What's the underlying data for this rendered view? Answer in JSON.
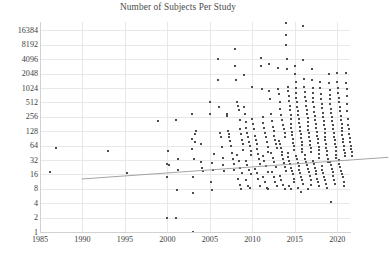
{
  "chart_data": {
    "type": "scatter",
    "title": "Number of Subjects Per Study",
    "xlabel": "",
    "ylabel": "",
    "yscale": "log2",
    "xlim": [
      1985,
      2021.5
    ],
    "ylim": [
      1,
      24576
    ],
    "grid": true,
    "legend": null,
    "ytick_labels": [
      "16384",
      "8192",
      "4096",
      "2048",
      "1024",
      "512",
      "256",
      "128",
      "64",
      "32",
      "16",
      "8",
      "4",
      "2",
      "1"
    ],
    "ytick_values": [
      16384,
      8192,
      4096,
      2048,
      1024,
      512,
      256,
      128,
      64,
      32,
      16,
      8,
      4,
      2,
      1
    ],
    "xtick_labels": [
      "1985",
      "1990",
      "1995",
      "2000",
      "2005",
      "2010",
      "2015",
      "2020"
    ],
    "xtick_values": [
      1985,
      1990,
      1995,
      2000,
      2005,
      2010,
      2015,
      2020
    ],
    "marker_color": "#4d4d4d",
    "marker_shape": "square",
    "marker_size_px": 2,
    "trendline": {
      "color": "#9a9a9a",
      "x_start": 1985.2,
      "y_start": 37,
      "x_end": 2021.3,
      "y_end": 105
    },
    "points": [
      [
        1986.2,
        18
      ],
      [
        1986.9,
        58
      ],
      [
        1993.0,
        50
      ],
      [
        1995.2,
        17
      ],
      [
        1998.9,
        210
      ],
      [
        1999.9,
        14
      ],
      [
        1999.9,
        2
      ],
      [
        2000.0,
        27
      ],
      [
        2000.1,
        50
      ],
      [
        2000.2,
        25
      ],
      [
        2001.0,
        220
      ],
      [
        2001.0,
        2
      ],
      [
        2001.1,
        7.5
      ],
      [
        2001.2,
        34
      ],
      [
        2001.3,
        20
      ],
      [
        2002.9,
        300
      ],
      [
        2002.9,
        90
      ],
      [
        2002.9,
        55
      ],
      [
        2003.0,
        1
      ],
      [
        2003.0,
        6.5
      ],
      [
        2003.0,
        14
      ],
      [
        2003.1,
        33
      ],
      [
        2003.2,
        75
      ],
      [
        2003.3,
        110
      ],
      [
        2003.4,
        130
      ],
      [
        2004.0,
        70
      ],
      [
        2004.0,
        29
      ],
      [
        2004.1,
        22
      ],
      [
        2004.2,
        19
      ],
      [
        2005.0,
        530
      ],
      [
        2005.0,
        300
      ],
      [
        2005.1,
        11
      ],
      [
        2005.2,
        7.5
      ],
      [
        2005.3,
        28
      ],
      [
        2005.4,
        20
      ],
      [
        2005.5,
        42
      ],
      [
        2006.0,
        4096
      ],
      [
        2006.0,
        1500
      ],
      [
        2006.1,
        420
      ],
      [
        2006.2,
        120
      ],
      [
        2006.3,
        95
      ],
      [
        2006.4,
        60
      ],
      [
        2006.5,
        36
      ],
      [
        2006.6,
        25
      ],
      [
        2006.7,
        19
      ],
      [
        2007.0,
        300
      ],
      [
        2007.0,
        260
      ],
      [
        2007.1,
        130
      ],
      [
        2007.2,
        110
      ],
      [
        2007.3,
        95
      ],
      [
        2007.4,
        80
      ],
      [
        2007.5,
        62
      ],
      [
        2007.6,
        44
      ],
      [
        2007.7,
        33
      ],
      [
        2007.8,
        26
      ],
      [
        2007.9,
        20
      ],
      [
        2008.0,
        6800
      ],
      [
        2008.0,
        2900
      ],
      [
        2008.1,
        1500
      ],
      [
        2008.2,
        520
      ],
      [
        2008.3,
        430
      ],
      [
        2008.4,
        350
      ],
      [
        2008.5,
        220
      ],
      [
        2008.6,
        140
      ],
      [
        2008.7,
        110
      ],
      [
        2008.8,
        85
      ],
      [
        2008.9,
        68
      ],
      [
        2008.95,
        52
      ],
      [
        2008.2,
        40
      ],
      [
        2008.4,
        30
      ],
      [
        2008.6,
        22
      ],
      [
        2008.8,
        17
      ],
      [
        2008.3,
        13
      ],
      [
        2008.5,
        9.5
      ],
      [
        2008.7,
        8
      ],
      [
        2009.0,
        1900
      ],
      [
        2009.0,
        420
      ],
      [
        2009.1,
        290
      ],
      [
        2009.2,
        200
      ],
      [
        2009.3,
        150
      ],
      [
        2009.4,
        120
      ],
      [
        2009.5,
        95
      ],
      [
        2009.6,
        78
      ],
      [
        2009.7,
        62
      ],
      [
        2009.8,
        50
      ],
      [
        2009.9,
        40
      ],
      [
        2009.2,
        31
      ],
      [
        2009.4,
        25
      ],
      [
        2009.6,
        20
      ],
      [
        2009.8,
        16
      ],
      [
        2009.3,
        12
      ],
      [
        2009.5,
        9
      ],
      [
        2009.7,
        8.5
      ],
      [
        2010.0,
        1050
      ],
      [
        2010.0,
        230
      ],
      [
        2010.1,
        180
      ],
      [
        2010.2,
        140
      ],
      [
        2010.3,
        100
      ],
      [
        2010.4,
        82
      ],
      [
        2010.5,
        68
      ],
      [
        2010.6,
        54
      ],
      [
        2010.7,
        43
      ],
      [
        2010.8,
        34
      ],
      [
        2010.9,
        27
      ],
      [
        2010.3,
        21
      ],
      [
        2010.5,
        17
      ],
      [
        2010.7,
        13
      ],
      [
        2010.9,
        9
      ],
      [
        2011.0,
        4300
      ],
      [
        2011.0,
        3000
      ],
      [
        2011.1,
        1000
      ],
      [
        2011.2,
        250
      ],
      [
        2011.3,
        190
      ],
      [
        2011.4,
        150
      ],
      [
        2011.5,
        120
      ],
      [
        2011.6,
        95
      ],
      [
        2011.7,
        75
      ],
      [
        2011.8,
        60
      ],
      [
        2011.9,
        48
      ],
      [
        2011.2,
        38
      ],
      [
        2011.4,
        31
      ],
      [
        2011.6,
        24
      ],
      [
        2011.8,
        18
      ],
      [
        2011.3,
        14
      ],
      [
        2011.5,
        11
      ],
      [
        2011.7,
        8.5
      ],
      [
        2011.9,
        8
      ],
      [
        2012.0,
        3200
      ],
      [
        2012.0,
        900
      ],
      [
        2012.1,
        600
      ],
      [
        2012.2,
        300
      ],
      [
        2012.3,
        210
      ],
      [
        2012.4,
        160
      ],
      [
        2012.5,
        130
      ],
      [
        2012.6,
        100
      ],
      [
        2012.7,
        84
      ],
      [
        2012.8,
        70
      ],
      [
        2012.9,
        56
      ],
      [
        2012.2,
        45
      ],
      [
        2012.4,
        36
      ],
      [
        2012.6,
        29
      ],
      [
        2012.8,
        23
      ],
      [
        2012.3,
        18
      ],
      [
        2012.5,
        14
      ],
      [
        2012.7,
        11
      ],
      [
        2012.9,
        9
      ],
      [
        2013.0,
        2700
      ],
      [
        2013.0,
        1000
      ],
      [
        2013.1,
        780
      ],
      [
        2013.2,
        520
      ],
      [
        2013.3,
        380
      ],
      [
        2013.4,
        280
      ],
      [
        2013.5,
        220
      ],
      [
        2013.6,
        175
      ],
      [
        2013.7,
        140
      ],
      [
        2013.8,
        115
      ],
      [
        2013.9,
        95
      ],
      [
        2013.15,
        80
      ],
      [
        2013.25,
        68
      ],
      [
        2013.35,
        57
      ],
      [
        2013.45,
        48
      ],
      [
        2013.55,
        40
      ],
      [
        2013.65,
        33
      ],
      [
        2013.75,
        28
      ],
      [
        2013.85,
        23
      ],
      [
        2013.95,
        19
      ],
      [
        2013.2,
        15
      ],
      [
        2013.4,
        12
      ],
      [
        2013.6,
        9.5
      ],
      [
        2013.8,
        8
      ],
      [
        2014.0,
        24000
      ],
      [
        2014.0,
        13000
      ],
      [
        2014.0,
        8000
      ],
      [
        2014.1,
        4096
      ],
      [
        2014.1,
        2600
      ],
      [
        2014.2,
        1100
      ],
      [
        2014.2,
        900
      ],
      [
        2014.3,
        700
      ],
      [
        2014.3,
        550
      ],
      [
        2014.4,
        440
      ],
      [
        2014.4,
        350
      ],
      [
        2014.5,
        280
      ],
      [
        2014.5,
        225
      ],
      [
        2014.6,
        180
      ],
      [
        2014.6,
        150
      ],
      [
        2014.7,
        125
      ],
      [
        2014.7,
        105
      ],
      [
        2014.8,
        88
      ],
      [
        2014.8,
        74
      ],
      [
        2014.9,
        62
      ],
      [
        2014.9,
        52
      ],
      [
        2014.15,
        44
      ],
      [
        2014.25,
        37
      ],
      [
        2014.35,
        31
      ],
      [
        2014.45,
        26
      ],
      [
        2014.55,
        22
      ],
      [
        2014.65,
        19
      ],
      [
        2014.75,
        16
      ],
      [
        2014.85,
        13
      ],
      [
        2014.95,
        11
      ],
      [
        2014.3,
        9
      ],
      [
        2014.6,
        8
      ],
      [
        2015.0,
        3000
      ],
      [
        2015.0,
        2048
      ],
      [
        2015.1,
        1400
      ],
      [
        2015.1,
        1024
      ],
      [
        2015.2,
        820
      ],
      [
        2015.2,
        640
      ],
      [
        2015.3,
        520
      ],
      [
        2015.3,
        420
      ],
      [
        2015.4,
        340
      ],
      [
        2015.4,
        280
      ],
      [
        2015.5,
        230
      ],
      [
        2015.5,
        190
      ],
      [
        2015.6,
        158
      ],
      [
        2015.6,
        132
      ],
      [
        2015.7,
        110
      ],
      [
        2015.7,
        92
      ],
      [
        2015.8,
        78
      ],
      [
        2015.8,
        65
      ],
      [
        2015.9,
        55
      ],
      [
        2015.9,
        46
      ],
      [
        2015.15,
        39
      ],
      [
        2015.25,
        33
      ],
      [
        2015.35,
        28
      ],
      [
        2015.45,
        24
      ],
      [
        2015.55,
        20
      ],
      [
        2015.65,
        17
      ],
      [
        2015.75,
        14
      ],
      [
        2015.85,
        12
      ],
      [
        2015.95,
        10
      ],
      [
        2015.4,
        8.5
      ],
      [
        2015.7,
        7
      ],
      [
        2016.0,
        20000
      ],
      [
        2016.0,
        4000
      ],
      [
        2016.1,
        1600
      ],
      [
        2016.1,
        1100
      ],
      [
        2016.2,
        850
      ],
      [
        2016.2,
        660
      ],
      [
        2016.3,
        540
      ],
      [
        2016.3,
        440
      ],
      [
        2016.4,
        360
      ],
      [
        2016.4,
        295
      ],
      [
        2016.5,
        240
      ],
      [
        2016.5,
        200
      ],
      [
        2016.6,
        165
      ],
      [
        2016.6,
        138
      ],
      [
        2016.7,
        115
      ],
      [
        2016.7,
        96
      ],
      [
        2016.8,
        80
      ],
      [
        2016.8,
        67
      ],
      [
        2016.9,
        57
      ],
      [
        2016.9,
        48
      ],
      [
        2016.15,
        40
      ],
      [
        2016.25,
        34
      ],
      [
        2016.35,
        29
      ],
      [
        2016.45,
        25
      ],
      [
        2016.55,
        21
      ],
      [
        2016.65,
        18
      ],
      [
        2016.75,
        15
      ],
      [
        2016.85,
        12
      ],
      [
        2016.95,
        9.5
      ],
      [
        2016.5,
        8
      ],
      [
        2017.0,
        2600
      ],
      [
        2017.0,
        1500
      ],
      [
        2017.1,
        1024
      ],
      [
        2017.1,
        800
      ],
      [
        2017.2,
        640
      ],
      [
        2017.2,
        510
      ],
      [
        2017.3,
        410
      ],
      [
        2017.3,
        330
      ],
      [
        2017.4,
        270
      ],
      [
        2017.4,
        220
      ],
      [
        2017.5,
        180
      ],
      [
        2017.5,
        150
      ],
      [
        2017.6,
        125
      ],
      [
        2017.6,
        104
      ],
      [
        2017.7,
        87
      ],
      [
        2017.7,
        73
      ],
      [
        2017.8,
        61
      ],
      [
        2017.8,
        51
      ],
      [
        2017.9,
        43
      ],
      [
        2017.9,
        36
      ],
      [
        2017.15,
        30
      ],
      [
        2017.25,
        26
      ],
      [
        2017.35,
        22
      ],
      [
        2017.45,
        19
      ],
      [
        2017.55,
        16
      ],
      [
        2017.65,
        13
      ],
      [
        2017.75,
        11
      ],
      [
        2017.85,
        9
      ],
      [
        2018.0,
        1400
      ],
      [
        2018.0,
        1024
      ],
      [
        2018.1,
        780
      ],
      [
        2018.1,
        600
      ],
      [
        2018.2,
        480
      ],
      [
        2018.2,
        390
      ],
      [
        2018.3,
        315
      ],
      [
        2018.3,
        255
      ],
      [
        2018.4,
        210
      ],
      [
        2018.4,
        172
      ],
      [
        2018.5,
        142
      ],
      [
        2018.5,
        118
      ],
      [
        2018.6,
        98
      ],
      [
        2018.6,
        82
      ],
      [
        2018.7,
        69
      ],
      [
        2018.7,
        58
      ],
      [
        2018.8,
        49
      ],
      [
        2018.8,
        41
      ],
      [
        2018.9,
        34
      ],
      [
        2018.9,
        29
      ],
      [
        2018.15,
        24
      ],
      [
        2018.25,
        20
      ],
      [
        2018.35,
        17
      ],
      [
        2018.45,
        14
      ],
      [
        2018.55,
        12
      ],
      [
        2018.65,
        10
      ],
      [
        2018.75,
        8.5
      ],
      [
        2019.0,
        2000
      ],
      [
        2019.0,
        1300
      ],
      [
        2019.1,
        950
      ],
      [
        2019.1,
        740
      ],
      [
        2019.2,
        590
      ],
      [
        2019.2,
        470
      ],
      [
        2019.3,
        380
      ],
      [
        2019.3,
        310
      ],
      [
        2019.4,
        250
      ],
      [
        2019.4,
        205
      ],
      [
        2019.5,
        170
      ],
      [
        2019.5,
        142
      ],
      [
        2019.6,
        118
      ],
      [
        2019.6,
        99
      ],
      [
        2019.7,
        83
      ],
      [
        2019.7,
        70
      ],
      [
        2019.8,
        59
      ],
      [
        2019.8,
        49
      ],
      [
        2019.9,
        41
      ],
      [
        2019.9,
        35
      ],
      [
        2019.15,
        29
      ],
      [
        2019.25,
        25
      ],
      [
        2019.35,
        21
      ],
      [
        2019.45,
        18
      ],
      [
        2019.55,
        15
      ],
      [
        2019.65,
        12
      ],
      [
        2019.75,
        10
      ],
      [
        2019.3,
        4.2
      ],
      [
        2020.0,
        2100
      ],
      [
        2020.0,
        1400
      ],
      [
        2020.1,
        1024
      ],
      [
        2020.1,
        800
      ],
      [
        2020.2,
        640
      ],
      [
        2020.2,
        510
      ],
      [
        2020.3,
        410
      ],
      [
        2020.3,
        335
      ],
      [
        2020.4,
        272
      ],
      [
        2020.4,
        222
      ],
      [
        2020.5,
        184
      ],
      [
        2020.5,
        153
      ],
      [
        2020.6,
        128
      ],
      [
        2020.6,
        107
      ],
      [
        2020.7,
        90
      ],
      [
        2020.7,
        75
      ],
      [
        2020.8,
        63
      ],
      [
        2020.8,
        53
      ],
      [
        2020.9,
        45
      ],
      [
        2020.9,
        38
      ],
      [
        2020.15,
        32
      ],
      [
        2020.25,
        27
      ],
      [
        2020.35,
        23
      ],
      [
        2020.45,
        19
      ],
      [
        2020.55,
        16
      ],
      [
        2020.65,
        14
      ],
      [
        2020.75,
        11
      ],
      [
        2020.85,
        9
      ],
      [
        2021.0,
        2100
      ],
      [
        2021.0,
        1300
      ],
      [
        2021.1,
        1000
      ],
      [
        2021.1,
        700
      ],
      [
        2021.2,
        480
      ],
      [
        2021.2,
        340
      ],
      [
        2021.3,
        230
      ],
      [
        2021.3,
        175
      ],
      [
        2021.4,
        140
      ],
      [
        2021.4,
        112
      ],
      [
        2021.5,
        92
      ],
      [
        2021.5,
        76
      ],
      [
        2021.6,
        64
      ],
      [
        2021.6,
        54
      ],
      [
        2021.7,
        46
      ],
      [
        2021.7,
        39
      ],
      [
        2021.8,
        34
      ]
    ]
  }
}
